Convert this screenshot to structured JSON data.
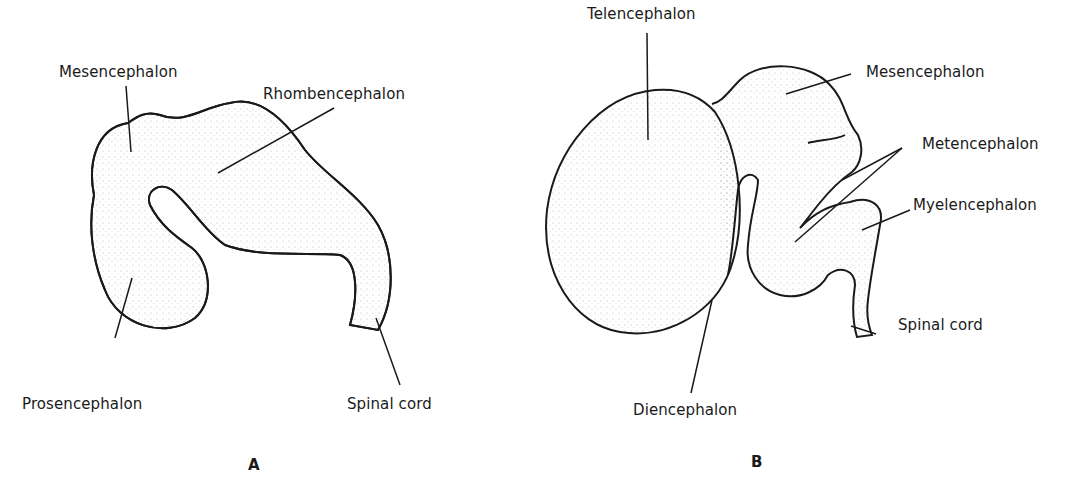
{
  "figure": {
    "panels": [
      {
        "id": "A",
        "label": "A",
        "structures": {
          "mesencephalon": "Mesencephalon",
          "rhombencephalon": "Rhombencephalon",
          "prosencephalon": "Prosencephalon",
          "spinal_cord": "Spinal cord"
        }
      },
      {
        "id": "B",
        "label": "B",
        "structures": {
          "telencephalon": "Telencephalon",
          "mesencephalon": "Mesencephalon",
          "metencephalon": "Metencephalon",
          "myelencephalon": "Myelencephalon",
          "spinal_cord": "Spinal cord",
          "diencephalon": "Diencephalon"
        }
      }
    ],
    "colors": {
      "ink": "#1a1a1a",
      "background": "#ffffff"
    }
  }
}
